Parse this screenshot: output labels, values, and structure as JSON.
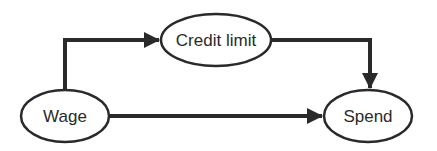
{
  "diagram": {
    "type": "causal-graph",
    "nodes": [
      {
        "id": "wage",
        "label": "Wage",
        "cx": 65,
        "cy": 116,
        "rx": 45,
        "ry": 27
      },
      {
        "id": "credit_limit",
        "label": "Credit limit",
        "cx": 216,
        "cy": 40,
        "rx": 56,
        "ry": 27
      },
      {
        "id": "spend",
        "label": "Spend",
        "cx": 368,
        "cy": 116,
        "rx": 45,
        "ry": 27
      }
    ],
    "edges": [
      {
        "from": "wage",
        "to": "credit_limit"
      },
      {
        "from": "credit_limit",
        "to": "spend"
      },
      {
        "from": "wage",
        "to": "spend"
      }
    ],
    "colors": {
      "stroke": "#2a2a2a",
      "background": "#ffffff"
    }
  }
}
